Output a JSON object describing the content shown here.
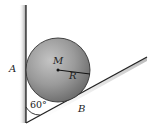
{
  "diagram": {
    "type": "physics-statics",
    "labels": {
      "center": "M",
      "radius": "R",
      "contact_wall": "A",
      "contact_incline": "B",
      "angle": "60°"
    },
    "colors": {
      "ball_light": "#b9b9b9",
      "ball_dark": "#6e6e6e",
      "line": "#222222",
      "wall_shade": "#9a9a9a"
    }
  }
}
